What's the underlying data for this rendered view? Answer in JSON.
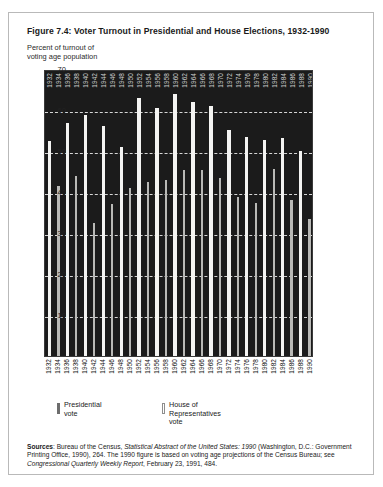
{
  "figure": {
    "title": "Figure 7.4: Voter Turnout in Presidential and House Elections, 1932-1990",
    "axis_caption_line1": "Percent of turnout of",
    "axis_caption_line2": "voting age population"
  },
  "legend": {
    "presidential": {
      "line1": "Presidential",
      "line2": "vote",
      "swatch": "solid-dark-bar-icon"
    },
    "house": {
      "line1": "House of",
      "line2": "Representatives",
      "line3": "vote",
      "swatch": "hollow-light-bar-icon"
    }
  },
  "sources": {
    "label": "Sources",
    "part1": ": Bureau of the Census, ",
    "italic1": "Statistical Abstract of the United States: 1990",
    "part2": " (Washington, D.C.: Government Printing Office, 1990), 264. The 1990 figure is based on voting age projections of the Census Bureau; see ",
    "italic2": "Congressional Quarterly Weekly Report",
    "part3": ", February 23, 1991, 484."
  },
  "chart_data": {
    "type": "bar",
    "title": "Figure 7.4: Voter Turnout in Presidential and House Elections, 1932-1990",
    "xlabel": "",
    "ylabel": "Percent of turnout of voting age population",
    "ylim": [
      0,
      70
    ],
    "yticks": [
      10,
      20,
      30,
      40,
      50,
      60,
      70
    ],
    "grid": true,
    "grid_style": "dashed-white-horizontal",
    "legend_position": "below-plot",
    "background_color": "#1b1b1b",
    "series": [
      {
        "name": "Presidential vote",
        "color": "#f4f4f2"
      },
      {
        "name": "House of Representatives vote",
        "color": "#b9b9b6"
      }
    ],
    "categories": [
      "1932",
      "1934",
      "1936",
      "1938",
      "1940",
      "1942",
      "1944",
      "1946",
      "1948",
      "1950",
      "1952",
      "1954",
      "1956",
      "1958",
      "1960",
      "1962",
      "1964",
      "1966",
      "1968",
      "1970",
      "1972",
      "1974",
      "1976",
      "1978",
      "1980",
      "1982",
      "1984",
      "1986",
      "1988",
      "1990"
    ],
    "points": [
      {
        "year": "1932",
        "series": "Presidential vote",
        "value": 52.4
      },
      {
        "year": "1934",
        "series": "House of Representatives vote",
        "value": 41.4
      },
      {
        "year": "1936",
        "series": "Presidential vote",
        "value": 56.9
      },
      {
        "year": "1938",
        "series": "House of Representatives vote",
        "value": 44.0
      },
      {
        "year": "1940",
        "series": "Presidential vote",
        "value": 58.9
      },
      {
        "year": "1942",
        "series": "House of Representatives vote",
        "value": 32.5
      },
      {
        "year": "1944",
        "series": "Presidential vote",
        "value": 56.0
      },
      {
        "year": "1946",
        "series": "House of Representatives vote",
        "value": 37.1
      },
      {
        "year": "1948",
        "series": "Presidential vote",
        "value": 51.1
      },
      {
        "year": "1950",
        "series": "House of Representatives vote",
        "value": 41.1
      },
      {
        "year": "1952",
        "series": "Presidential vote",
        "value": 63.0
      },
      {
        "year": "1954",
        "series": "House of Representatives vote",
        "value": 42.4
      },
      {
        "year": "1956",
        "series": "Presidential vote",
        "value": 60.4
      },
      {
        "year": "1958",
        "series": "House of Representatives vote",
        "value": 43.0
      },
      {
        "year": "1960",
        "series": "Presidential vote",
        "value": 64.0
      },
      {
        "year": "1962",
        "series": "House of Representatives vote",
        "value": 45.4
      },
      {
        "year": "1964",
        "series": "Presidential vote",
        "value": 61.9
      },
      {
        "year": "1966",
        "series": "House of Representatives vote",
        "value": 45.4
      },
      {
        "year": "1968",
        "series": "Presidential vote",
        "value": 60.9
      },
      {
        "year": "1970",
        "series": "House of Representatives vote",
        "value": 43.5
      },
      {
        "year": "1972",
        "series": "Presidential vote",
        "value": 55.2
      },
      {
        "year": "1974",
        "series": "House of Representatives vote",
        "value": 38.9
      },
      {
        "year": "1976",
        "series": "Presidential vote",
        "value": 53.5
      },
      {
        "year": "1978",
        "series": "House of Representatives vote",
        "value": 37.2
      },
      {
        "year": "1980",
        "series": "Presidential vote",
        "value": 52.6
      },
      {
        "year": "1982",
        "series": "House of Representatives vote",
        "value": 45.5
      },
      {
        "year": "1984",
        "series": "Presidential vote",
        "value": 53.1
      },
      {
        "year": "1986",
        "series": "House of Representatives vote",
        "value": 38.0
      },
      {
        "year": "1988",
        "series": "Presidential vote",
        "value": 50.1
      },
      {
        "year": "1990",
        "series": "House of Representatives vote",
        "value": 33.5
      }
    ]
  }
}
